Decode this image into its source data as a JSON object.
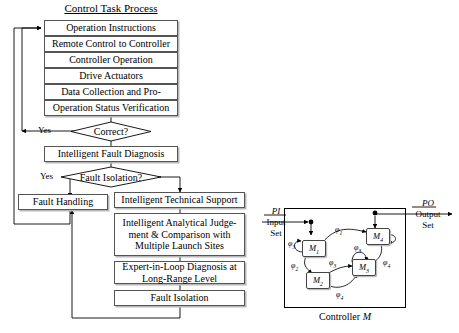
{
  "figure": {
    "flowchart": {
      "title": "Control Task Process",
      "boxes": [
        {
          "id": "operation-instructions",
          "label": "Operation Instructions"
        },
        {
          "id": "remote-control",
          "label": "Remote Control to Controller"
        },
        {
          "id": "controller-operation",
          "label": "Controller Operation"
        },
        {
          "id": "drive-actuators",
          "label": "Drive Actuators"
        },
        {
          "id": "data-collection",
          "label": "Data Collection and Pro-"
        },
        {
          "id": "operation-status-verification",
          "label": "Operation Status Verification"
        },
        {
          "id": "intelligent-fault-diagnosis",
          "label": "Intelligent Fault Diagnosis"
        },
        {
          "id": "fault-handling",
          "label": "Fault Handling"
        },
        {
          "id": "intelligent-technical-support",
          "label": "Intelligent Technical Support"
        },
        {
          "id": "intelligent-analytical-judgement",
          "label": "Intelligent Analytical Judge-\nment & Comparison with\nMultiple Launch Sites"
        },
        {
          "id": "expert-in-loop-diagnosis",
          "label": "Expert-in-Loop Diagnosis at\nLong-Range Level"
        },
        {
          "id": "fault-isolation-result",
          "label": "Fault Isolation"
        }
      ],
      "decisions": [
        {
          "id": "correct",
          "label": "Correct?",
          "branch_label": "Yes"
        },
        {
          "id": "fault-isolation",
          "label": "Fault Isolation?",
          "branch_label": "Yes"
        }
      ]
    },
    "automaton": {
      "caption_prefix": "Controller ",
      "caption_symbol": "M",
      "input": {
        "symbol": "PI",
        "line1": "Input",
        "line2": "Set"
      },
      "output": {
        "symbol": "PO",
        "line1": "Output",
        "line2": "Set"
      },
      "states": [
        {
          "id": "m1",
          "name": "M",
          "index": "1"
        },
        {
          "id": "m2",
          "name": "M",
          "index": "2"
        },
        {
          "id": "m3",
          "name": "M",
          "index": "3"
        },
        {
          "id": "m4",
          "name": "M",
          "index": "4"
        }
      ],
      "transitions": [
        {
          "id": "phi3-self-m1",
          "symbol": "φ",
          "index": "3"
        },
        {
          "id": "phi1-m1-m4",
          "symbol": "φ",
          "index": "1"
        },
        {
          "id": "phi2-m1-m2",
          "symbol": "φ",
          "index": "2"
        },
        {
          "id": "phi3-m2-m3",
          "symbol": "φ",
          "index": "3"
        },
        {
          "id": "phi3-self-m3",
          "symbol": "φ",
          "index": "3"
        },
        {
          "id": "phi4-m3-m4",
          "symbol": "φ",
          "index": "4"
        },
        {
          "id": "phi4-m2-m3",
          "symbol": "φ",
          "index": "4"
        }
      ]
    }
  },
  "colors": {
    "stroke": "#000000",
    "box_border": "#555555",
    "box_shadow": "#b8b8b8",
    "background": "#ffffff"
  }
}
